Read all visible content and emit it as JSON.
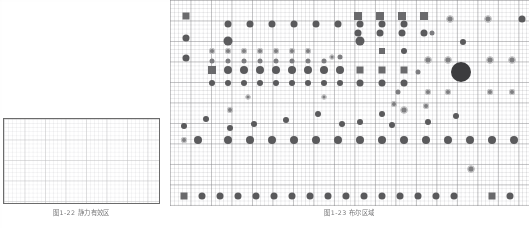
{
  "page": {
    "kind": "scanned-book-page-figures",
    "background_color": "#fefefe",
    "grid_minor_color": "#9696a0",
    "grid_major_color": "#82828f",
    "marker_color": "#5a5a62",
    "marker_square_color": "#6a6a72",
    "marker_ring_color": "#7e7e88",
    "marker_large_color": "#3d3d45"
  },
  "figure_left": {
    "caption": "图1-22  静力有效区",
    "border_color": "#6b6b6b",
    "content": ""
  },
  "figure_right": {
    "caption": "图1-23  布尔区域",
    "inline_labels": [
      {
        "text": "n=1",
        "x": 58,
        "y": 43
      },
      {
        "text": "n=2",
        "x": 190,
        "y": 43
      }
    ]
  },
  "chart_data": {
    "type": "scatter",
    "title": "",
    "xlabel": "",
    "ylabel": "",
    "grid": true,
    "legend": "none",
    "xlim": [
      0,
      359
    ],
    "ylim": [
      0,
      206
    ],
    "marker_kinds": [
      "dot",
      "sq",
      "ring",
      "small",
      "big"
    ],
    "points": [
      {
        "x": 16,
        "y": 16,
        "k": "sq",
        "s": 7
      },
      {
        "x": 16,
        "y": 38,
        "k": "dot",
        "s": 7
      },
      {
        "x": 16,
        "y": 58,
        "k": "dot",
        "s": 7
      },
      {
        "x": 58,
        "y": 24,
        "k": "dot",
        "s": 7
      },
      {
        "x": 80,
        "y": 24,
        "k": "dot",
        "s": 7
      },
      {
        "x": 102,
        "y": 24,
        "k": "dot",
        "s": 7
      },
      {
        "x": 124,
        "y": 24,
        "k": "dot",
        "s": 7
      },
      {
        "x": 146,
        "y": 24,
        "k": "dot",
        "s": 7
      },
      {
        "x": 168,
        "y": 24,
        "k": "dot",
        "s": 7
      },
      {
        "x": 190,
        "y": 24,
        "k": "dot",
        "s": 7
      },
      {
        "x": 212,
        "y": 24,
        "k": "dot",
        "s": 7
      },
      {
        "x": 234,
        "y": 24,
        "k": "dot",
        "s": 7
      },
      {
        "x": 58,
        "y": 41,
        "k": "dot",
        "s": 9
      },
      {
        "x": 190,
        "y": 41,
        "k": "dot",
        "s": 9
      },
      {
        "x": 42,
        "y": 51,
        "k": "ring",
        "s": 6
      },
      {
        "x": 58,
        "y": 51,
        "k": "ring",
        "s": 6
      },
      {
        "x": 74,
        "y": 51,
        "k": "ring",
        "s": 6
      },
      {
        "x": 90,
        "y": 51,
        "k": "ring",
        "s": 6
      },
      {
        "x": 106,
        "y": 51,
        "k": "ring",
        "s": 6
      },
      {
        "x": 122,
        "y": 51,
        "k": "ring",
        "s": 6
      },
      {
        "x": 138,
        "y": 51,
        "k": "ring",
        "s": 6
      },
      {
        "x": 162,
        "y": 57,
        "k": "ring",
        "s": 5
      },
      {
        "x": 212,
        "y": 51,
        "k": "sq",
        "s": 6
      },
      {
        "x": 234,
        "y": 51,
        "k": "dot",
        "s": 6
      },
      {
        "x": 42,
        "y": 61,
        "k": "small",
        "s": 5
      },
      {
        "x": 58,
        "y": 61,
        "k": "small",
        "s": 5
      },
      {
        "x": 74,
        "y": 61,
        "k": "small",
        "s": 5
      },
      {
        "x": 90,
        "y": 61,
        "k": "small",
        "s": 5
      },
      {
        "x": 106,
        "y": 61,
        "k": "small",
        "s": 5
      },
      {
        "x": 122,
        "y": 61,
        "k": "small",
        "s": 5
      },
      {
        "x": 138,
        "y": 61,
        "k": "small",
        "s": 5
      },
      {
        "x": 154,
        "y": 61,
        "k": "small",
        "s": 5
      },
      {
        "x": 170,
        "y": 57,
        "k": "small",
        "s": 5
      },
      {
        "x": 42,
        "y": 70,
        "k": "sq",
        "s": 8
      },
      {
        "x": 58,
        "y": 70,
        "k": "dot",
        "s": 8
      },
      {
        "x": 74,
        "y": 70,
        "k": "dot",
        "s": 8
      },
      {
        "x": 90,
        "y": 70,
        "k": "dot",
        "s": 8
      },
      {
        "x": 106,
        "y": 70,
        "k": "dot",
        "s": 8
      },
      {
        "x": 122,
        "y": 70,
        "k": "dot",
        "s": 8
      },
      {
        "x": 138,
        "y": 70,
        "k": "dot",
        "s": 8
      },
      {
        "x": 154,
        "y": 70,
        "k": "dot",
        "s": 8
      },
      {
        "x": 170,
        "y": 70,
        "k": "dot",
        "s": 8
      },
      {
        "x": 42,
        "y": 83,
        "k": "dot",
        "s": 6
      },
      {
        "x": 58,
        "y": 83,
        "k": "dot",
        "s": 6
      },
      {
        "x": 74,
        "y": 83,
        "k": "dot",
        "s": 6
      },
      {
        "x": 90,
        "y": 83,
        "k": "dot",
        "s": 6
      },
      {
        "x": 106,
        "y": 83,
        "k": "dot",
        "s": 6
      },
      {
        "x": 122,
        "y": 83,
        "k": "dot",
        "s": 6
      },
      {
        "x": 138,
        "y": 83,
        "k": "dot",
        "s": 6
      },
      {
        "x": 154,
        "y": 83,
        "k": "dot",
        "s": 6
      },
      {
        "x": 170,
        "y": 83,
        "k": "dot",
        "s": 6
      },
      {
        "x": 190,
        "y": 70,
        "k": "sq",
        "s": 7
      },
      {
        "x": 212,
        "y": 70,
        "k": "sq",
        "s": 7
      },
      {
        "x": 234,
        "y": 70,
        "k": "sq",
        "s": 7
      },
      {
        "x": 190,
        "y": 83,
        "k": "dot",
        "s": 7
      },
      {
        "x": 212,
        "y": 83,
        "k": "dot",
        "s": 7
      },
      {
        "x": 234,
        "y": 83,
        "k": "dot",
        "s": 7
      },
      {
        "x": 248,
        "y": 72,
        "k": "small",
        "s": 5
      },
      {
        "x": 228,
        "y": 92,
        "k": "small",
        "s": 5
      },
      {
        "x": 188,
        "y": 16,
        "k": "sq",
        "s": 8
      },
      {
        "x": 210,
        "y": 16,
        "k": "sq",
        "s": 8
      },
      {
        "x": 232,
        "y": 16,
        "k": "sq",
        "s": 8
      },
      {
        "x": 254,
        "y": 16,
        "k": "sq",
        "s": 8
      },
      {
        "x": 188,
        "y": 33,
        "k": "dot",
        "s": 7
      },
      {
        "x": 210,
        "y": 33,
        "k": "dot",
        "s": 7
      },
      {
        "x": 232,
        "y": 33,
        "k": "dot",
        "s": 7
      },
      {
        "x": 254,
        "y": 33,
        "k": "dot",
        "s": 7
      },
      {
        "x": 280,
        "y": 19,
        "k": "ring",
        "s": 7
      },
      {
        "x": 318,
        "y": 19,
        "k": "ring",
        "s": 7
      },
      {
        "x": 352,
        "y": 19,
        "k": "dot",
        "s": 7
      },
      {
        "x": 262,
        "y": 33,
        "k": "small",
        "s": 5
      },
      {
        "x": 293,
        "y": 42,
        "k": "dot",
        "s": 6
      },
      {
        "x": 258,
        "y": 60,
        "k": "ring",
        "s": 7
      },
      {
        "x": 278,
        "y": 60,
        "k": "ring",
        "s": 7
      },
      {
        "x": 320,
        "y": 60,
        "k": "ring",
        "s": 7
      },
      {
        "x": 342,
        "y": 60,
        "k": "ring",
        "s": 7
      },
      {
        "x": 291,
        "y": 72,
        "k": "big",
        "s": 20
      },
      {
        "x": 224,
        "y": 104,
        "k": "ring",
        "s": 6
      },
      {
        "x": 256,
        "y": 106,
        "k": "ring",
        "s": 6
      },
      {
        "x": 258,
        "y": 92,
        "k": "ring",
        "s": 6
      },
      {
        "x": 278,
        "y": 92,
        "k": "ring",
        "s": 6
      },
      {
        "x": 320,
        "y": 92,
        "k": "ring",
        "s": 6
      },
      {
        "x": 342,
        "y": 92,
        "k": "ring",
        "s": 6
      },
      {
        "x": 14,
        "y": 126,
        "k": "dot",
        "s": 6
      },
      {
        "x": 36,
        "y": 119,
        "k": "dot",
        "s": 6
      },
      {
        "x": 60,
        "y": 110,
        "k": "ring",
        "s": 6
      },
      {
        "x": 60,
        "y": 128,
        "k": "dot",
        "s": 6
      },
      {
        "x": 84,
        "y": 124,
        "k": "dot",
        "s": 6
      },
      {
        "x": 116,
        "y": 120,
        "k": "dot",
        "s": 6
      },
      {
        "x": 148,
        "y": 114,
        "k": "dot",
        "s": 6
      },
      {
        "x": 172,
        "y": 124,
        "k": "dot",
        "s": 6
      },
      {
        "x": 190,
        "y": 122,
        "k": "dot",
        "s": 6
      },
      {
        "x": 212,
        "y": 114,
        "k": "dot",
        "s": 6
      },
      {
        "x": 222,
        "y": 125,
        "k": "dot",
        "s": 6
      },
      {
        "x": 234,
        "y": 110,
        "k": "ring",
        "s": 7
      },
      {
        "x": 258,
        "y": 122,
        "k": "dot",
        "s": 6
      },
      {
        "x": 286,
        "y": 116,
        "k": "dot",
        "s": 6
      },
      {
        "x": 14,
        "y": 140,
        "k": "ring",
        "s": 6
      },
      {
        "x": 28,
        "y": 140,
        "k": "dot",
        "s": 8
      },
      {
        "x": 58,
        "y": 140,
        "k": "dot",
        "s": 8
      },
      {
        "x": 80,
        "y": 140,
        "k": "dot",
        "s": 8
      },
      {
        "x": 102,
        "y": 140,
        "k": "dot",
        "s": 8
      },
      {
        "x": 124,
        "y": 140,
        "k": "dot",
        "s": 8
      },
      {
        "x": 146,
        "y": 140,
        "k": "dot",
        "s": 8
      },
      {
        "x": 168,
        "y": 140,
        "k": "dot",
        "s": 8
      },
      {
        "x": 190,
        "y": 140,
        "k": "dot",
        "s": 8
      },
      {
        "x": 212,
        "y": 140,
        "k": "dot",
        "s": 8
      },
      {
        "x": 234,
        "y": 140,
        "k": "dot",
        "s": 8
      },
      {
        "x": 256,
        "y": 140,
        "k": "dot",
        "s": 8
      },
      {
        "x": 278,
        "y": 140,
        "k": "dot",
        "s": 8
      },
      {
        "x": 300,
        "y": 140,
        "k": "dot",
        "s": 8
      },
      {
        "x": 322,
        "y": 140,
        "k": "dot",
        "s": 8
      },
      {
        "x": 344,
        "y": 140,
        "k": "dot",
        "s": 8
      },
      {
        "x": 301,
        "y": 169,
        "k": "ring",
        "s": 7
      },
      {
        "x": 14,
        "y": 196,
        "k": "sq",
        "s": 7
      },
      {
        "x": 32,
        "y": 196,
        "k": "dot",
        "s": 7
      },
      {
        "x": 50,
        "y": 196,
        "k": "dot",
        "s": 7
      },
      {
        "x": 68,
        "y": 196,
        "k": "dot",
        "s": 7
      },
      {
        "x": 86,
        "y": 196,
        "k": "dot",
        "s": 7
      },
      {
        "x": 104,
        "y": 196,
        "k": "dot",
        "s": 7
      },
      {
        "x": 122,
        "y": 196,
        "k": "dot",
        "s": 7
      },
      {
        "x": 140,
        "y": 196,
        "k": "dot",
        "s": 7
      },
      {
        "x": 158,
        "y": 196,
        "k": "dot",
        "s": 7
      },
      {
        "x": 176,
        "y": 196,
        "k": "dot",
        "s": 7
      },
      {
        "x": 194,
        "y": 196,
        "k": "dot",
        "s": 7
      },
      {
        "x": 212,
        "y": 196,
        "k": "dot",
        "s": 7
      },
      {
        "x": 230,
        "y": 196,
        "k": "dot",
        "s": 7
      },
      {
        "x": 248,
        "y": 196,
        "k": "dot",
        "s": 7
      },
      {
        "x": 266,
        "y": 196,
        "k": "dot",
        "s": 7
      },
      {
        "x": 284,
        "y": 196,
        "k": "dot",
        "s": 7
      },
      {
        "x": 322,
        "y": 196,
        "k": "sq",
        "s": 7
      },
      {
        "x": 340,
        "y": 196,
        "k": "dot",
        "s": 7
      },
      {
        "x": 78,
        "y": 97,
        "k": "ring",
        "s": 5
      },
      {
        "x": 154,
        "y": 97,
        "k": "ring",
        "s": 5
      }
    ]
  }
}
